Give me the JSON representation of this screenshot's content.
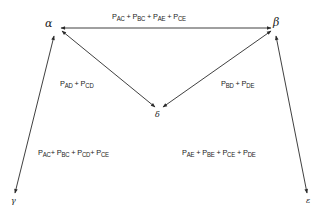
{
  "nodes": {
    "alpha": {
      "symbol": "α"
    },
    "beta": {
      "symbol": "β"
    },
    "gamma": {
      "symbol": "γ"
    },
    "delta": {
      "symbol": "δ"
    },
    "epsilon": {
      "symbol": "ε"
    }
  },
  "edge_labels": {
    "alpha_beta": [
      {
        "p": "P",
        "sub": "AC"
      },
      {
        "op": " + "
      },
      {
        "p": "P",
        "sub": "BC"
      },
      {
        "op": " + "
      },
      {
        "p": "P",
        "sub": "AE"
      },
      {
        "op": " + "
      },
      {
        "p": "P",
        "sub": "CE"
      }
    ],
    "alpha_delta": [
      {
        "p": "P",
        "sub": "AD"
      },
      {
        "op": " + "
      },
      {
        "p": "P",
        "sub": "CD"
      }
    ],
    "beta_delta": [
      {
        "p": "P",
        "sub": "BD"
      },
      {
        "op": " + "
      },
      {
        "p": "P",
        "sub": "DE"
      }
    ],
    "alpha_gamma": [
      {
        "p": "P",
        "sub": "AC"
      },
      {
        "op": "+ "
      },
      {
        "p": "P",
        "sub": "BC"
      },
      {
        "op": " + "
      },
      {
        "p": "P",
        "sub": "CD"
      },
      {
        "op": "+ "
      },
      {
        "p": "P",
        "sub": "CE"
      }
    ],
    "beta_epsilon": [
      {
        "p": "P",
        "sub": "AE"
      },
      {
        "op": " + "
      },
      {
        "p": "P",
        "sub": "BE"
      },
      {
        "op": " + "
      },
      {
        "p": "P",
        "sub": "CE"
      },
      {
        "op": " + "
      },
      {
        "p": "P",
        "sub": "DE"
      }
    ]
  },
  "colors": {
    "stroke": "#2a2a2a",
    "text": "#222222",
    "background": "#ffffff"
  }
}
